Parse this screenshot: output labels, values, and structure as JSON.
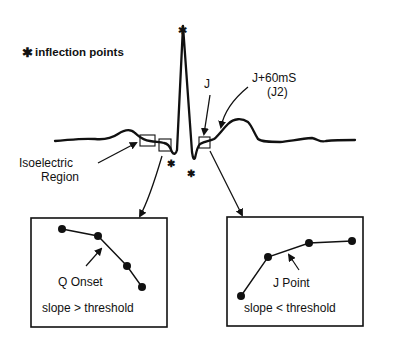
{
  "legend": {
    "symbol": "✱",
    "text": "inflection points"
  },
  "labels": {
    "j": "J",
    "j60_line1": "J+60mS",
    "j60_line2": "(J2)",
    "isoelectric_line1": "Isoelectric",
    "isoelectric_line2": "Region"
  },
  "markers": {
    "asterisk": "✱"
  },
  "left_panel": {
    "point_label": "Q Onset",
    "rule": "slope > threshold"
  },
  "right_panel": {
    "point_label": "J Point",
    "rule": "slope < threshold"
  },
  "colors": {
    "ink": "#111111",
    "background": "#ffffff"
  }
}
